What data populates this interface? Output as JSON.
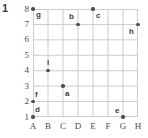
{
  "problem": {
    "number": "1"
  },
  "chart_data": {
    "type": "scatter",
    "title": "",
    "xlabel": "",
    "ylabel": "",
    "grid": true,
    "legend": null,
    "x_tick_labels": [
      "A",
      "B",
      "C",
      "D",
      "E",
      "F",
      "G",
      "H"
    ],
    "y_tick_labels": [
      "1",
      "2",
      "3",
      "4",
      "5",
      "6",
      "7",
      "8"
    ],
    "ylim": [
      1,
      8
    ],
    "xlim": [
      "A",
      "H"
    ],
    "point_color": "#4d4d4d",
    "grid_color": "#cccccc",
    "points": [
      {
        "label": "g",
        "x": "A",
        "y": 8,
        "xi": 0,
        "label_dx": 3,
        "label_dy": 2
      },
      {
        "label": "b",
        "x": "D",
        "y": 7,
        "xi": 3,
        "label_dx": -9,
        "label_dy": -11
      },
      {
        "label": "c",
        "x": "E",
        "y": 8,
        "xi": 4,
        "label_dx": 3,
        "label_dy": 3
      },
      {
        "label": "h",
        "x": "H",
        "y": 7,
        "xi": 7,
        "label_dx": -9,
        "label_dy": 4
      },
      {
        "label": "i",
        "x": "B",
        "y": 4,
        "xi": 1,
        "label_dx": -1,
        "label_dy": -12
      },
      {
        "label": "a",
        "x": "C",
        "y": 3,
        "xi": 2,
        "label_dx": 2,
        "label_dy": 4
      },
      {
        "label": "f",
        "x": "A",
        "y": 2,
        "xi": 0,
        "label_dx": 2,
        "label_dy": -11
      },
      {
        "label": "d",
        "x": "A",
        "y": 1,
        "xi": 0,
        "label_dx": 2,
        "label_dy": -11
      },
      {
        "label": "e",
        "x": "G",
        "y": 1,
        "xi": 6,
        "label_dx": -8,
        "label_dy": -10
      }
    ]
  }
}
